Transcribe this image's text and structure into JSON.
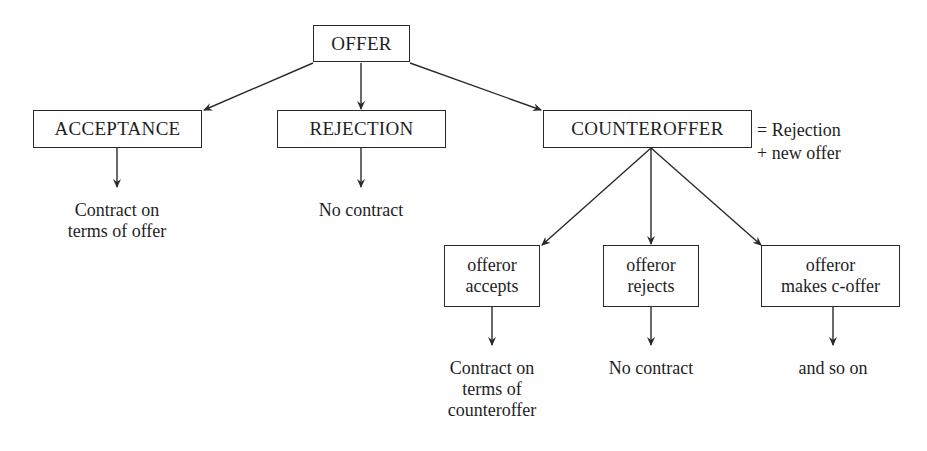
{
  "diagram": {
    "type": "flowchart-tree",
    "nodes": {
      "offer": "OFFER",
      "acceptance": "ACCEPTANCE",
      "rejection": "REJECTION",
      "counteroffer": "COUNTEROFFER",
      "offeror_accepts": {
        "line1": "offeror",
        "line2": "accepts"
      },
      "offeror_rejects": {
        "line1": "offeror",
        "line2": "rejects"
      },
      "offeror_makes_coffer": {
        "line1": "offeror",
        "line2": "makes c-offer"
      }
    },
    "annotation": {
      "line1": "= Rejection",
      "line2": "+ new offer"
    },
    "outcomes": {
      "acceptance": {
        "line1": "Contract on",
        "line2": "terms of offer"
      },
      "rejection": {
        "line1": "No contract"
      },
      "offeror_accepts": {
        "line1": "Contract on",
        "line2": "terms of",
        "line3": "counteroffer"
      },
      "offeror_rejects": {
        "line1": "No contract"
      },
      "offeror_makes_coffer": {
        "line1": "and so on"
      }
    },
    "edges": [
      [
        "OFFER",
        "ACCEPTANCE"
      ],
      [
        "OFFER",
        "REJECTION"
      ],
      [
        "OFFER",
        "COUNTEROFFER"
      ],
      [
        "ACCEPTANCE",
        "Contract on terms of offer"
      ],
      [
        "REJECTION",
        "No contract"
      ],
      [
        "COUNTEROFFER",
        "offeror accepts"
      ],
      [
        "COUNTEROFFER",
        "offeror rejects"
      ],
      [
        "COUNTEROFFER",
        "offeror makes c-offer"
      ],
      [
        "offeror accepts",
        "Contract on terms of counteroffer"
      ],
      [
        "offeror rejects",
        "No contract"
      ],
      [
        "offeror makes c-offer",
        "and so on"
      ]
    ],
    "colors": {
      "line": "#2a2a2a",
      "text": "#1e1e1e",
      "background": "#ffffff"
    }
  }
}
